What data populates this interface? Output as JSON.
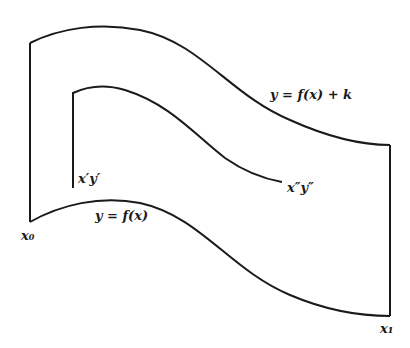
{
  "diagram": {
    "type": "region-between-curves",
    "labels": {
      "upper_curve": "y = f(x) + k",
      "lower_curve": "y = f(x)",
      "inner_start": "x′y′",
      "inner_end": "x″y″",
      "left_bound": "x₀",
      "right_bound": "x₁"
    },
    "colors": {
      "stroke": "#1a1a1a",
      "background": "#ffffff"
    }
  }
}
